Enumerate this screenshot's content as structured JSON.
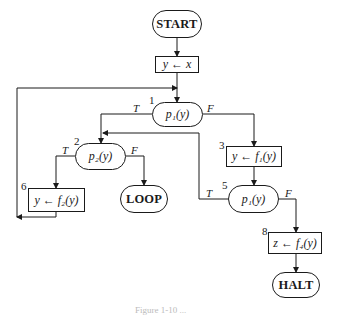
{
  "diagram": {
    "type": "flowchart",
    "nodes": {
      "start": {
        "label": "START",
        "kind": "terminal"
      },
      "assign_y_x": {
        "label": "y ← x",
        "kind": "process"
      },
      "n1": {
        "number": "1",
        "label": "p₁(y)",
        "kind": "decision"
      },
      "n2": {
        "number": "2",
        "label": "p₂(y)",
        "kind": "decision"
      },
      "n3": {
        "number": "3",
        "label": "y ← f₁(y)",
        "kind": "process"
      },
      "n5": {
        "number": "5",
        "label": "p₁(y)",
        "kind": "decision"
      },
      "n6": {
        "number": "6",
        "label": "y ← f₂(y)",
        "kind": "process"
      },
      "n8": {
        "number": "8",
        "label": "z ← f₄(y)",
        "kind": "process"
      },
      "loop": {
        "label": "LOOP",
        "kind": "terminal"
      },
      "halt": {
        "label": "HALT",
        "kind": "terminal"
      }
    },
    "branch_labels": {
      "true": "T",
      "false": "F"
    },
    "edges": [
      {
        "from": "START",
        "to": "y ← x"
      },
      {
        "from": "y ← x",
        "to": "1"
      },
      {
        "from": "1",
        "to": "2",
        "label": "T"
      },
      {
        "from": "1",
        "to": "3",
        "label": "F"
      },
      {
        "from": "2",
        "to": "6",
        "label": "T"
      },
      {
        "from": "2",
        "to": "LOOP",
        "label": "F"
      },
      {
        "from": "3",
        "to": "5"
      },
      {
        "from": "5",
        "to": "2",
        "label": "T"
      },
      {
        "from": "5",
        "to": "8",
        "label": "F"
      },
      {
        "from": "6",
        "to": "1"
      },
      {
        "from": "8",
        "to": "HALT"
      }
    ],
    "caption": "Figure 1-10 ..."
  }
}
